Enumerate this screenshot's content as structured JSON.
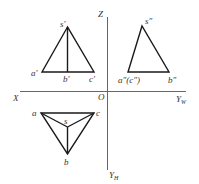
{
  "colors": {
    "line": "#1a1a1a",
    "axis": "#555555",
    "text": "#333333",
    "background": "#ffffff"
  },
  "axes": {
    "x_label": "X",
    "z_label": "Z",
    "origin_label": "O",
    "yw_label": "Y",
    "yw_sub": "W",
    "yh_label": "Y",
    "yh_sub": "H"
  },
  "front_view": {
    "s": "s′",
    "a": "a′",
    "b": "b′",
    "c": "c′"
  },
  "side_view": {
    "s": "s″",
    "ac": "a″(c″)",
    "b": "b″"
  },
  "top_view": {
    "s": "s",
    "a": "a",
    "b": "b",
    "c": "c"
  }
}
